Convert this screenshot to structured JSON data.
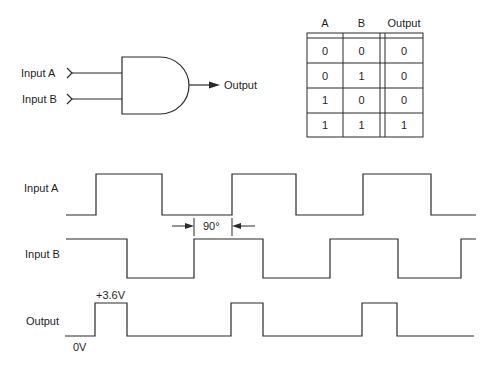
{
  "gate": {
    "type": "AND",
    "input_labels": [
      "Input A",
      "Input B"
    ],
    "output_label": "Output"
  },
  "truth_table": {
    "headers": [
      "A",
      "B",
      "Output"
    ],
    "rows": [
      [
        "0",
        "0",
        "0"
      ],
      [
        "0",
        "1",
        "0"
      ],
      [
        "1",
        "0",
        "0"
      ],
      [
        "1",
        "1",
        "1"
      ]
    ]
  },
  "timing": {
    "signals": [
      {
        "label": "Input A",
        "high_y": 174,
        "low_y": 215,
        "start_level": "low",
        "x_start": 66,
        "x_end": 476,
        "edges": [
          96,
          162,
          232,
          296,
          363,
          431
        ]
      },
      {
        "label": "Input B",
        "high_y": 239,
        "low_y": 278,
        "start_level": "high",
        "x_start": 66,
        "x_end": 476,
        "edges": [
          127,
          194,
          263,
          330,
          398,
          461
        ]
      },
      {
        "label": "Output",
        "high_y": 303,
        "low_y": 336,
        "start_level": "low",
        "x_start": 65,
        "x_end": 474,
        "edges": [
          95,
          127,
          231,
          263,
          362,
          397
        ]
      }
    ],
    "phase_annotation": {
      "text": "90°",
      "x_left": 194,
      "x_right": 232
    },
    "output_high_voltage": "+3.6V",
    "output_low_voltage": "0V"
  },
  "colors": {
    "line": "#2a2a2a",
    "background": "#ffffff"
  }
}
